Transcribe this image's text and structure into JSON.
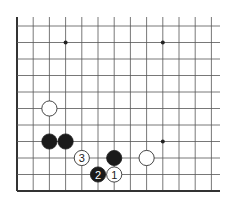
{
  "board": {
    "type": "go-board-diagram",
    "grid": {
      "origin_x": 17,
      "origin_y": 26,
      "spacing_x": 16.2,
      "spacing_y": 16.5,
      "columns": 13,
      "rows": 11,
      "top_extend": 17,
      "right_extend": 220,
      "line_color": "#555555",
      "edge_color": "#333333"
    },
    "star_points": [
      {
        "col": 3,
        "row": 1
      },
      {
        "col": 9,
        "row": 1
      },
      {
        "col": 9,
        "row": 7
      }
    ],
    "stones": [
      {
        "col": 2,
        "row": 5,
        "color": "white",
        "label": ""
      },
      {
        "col": 2,
        "row": 7,
        "color": "black",
        "label": ""
      },
      {
        "col": 3,
        "row": 7,
        "color": "black",
        "label": ""
      },
      {
        "col": 4,
        "row": 8,
        "color": "white",
        "label": "3"
      },
      {
        "col": 6,
        "row": 8,
        "color": "black",
        "label": ""
      },
      {
        "col": 8,
        "row": 8,
        "color": "white",
        "label": ""
      },
      {
        "col": 5,
        "row": 9,
        "color": "black",
        "label": "2"
      },
      {
        "col": 6,
        "row": 9,
        "color": "white",
        "label": "1"
      }
    ]
  }
}
